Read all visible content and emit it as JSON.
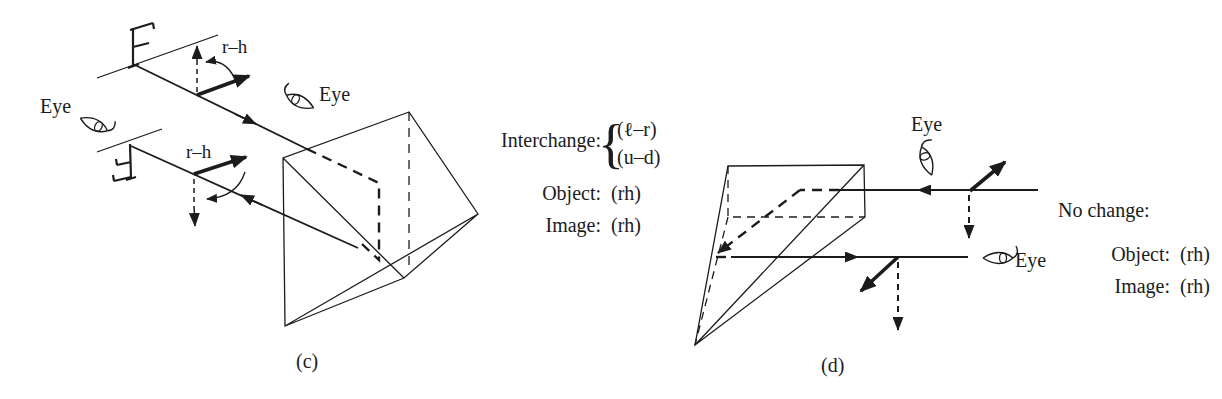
{
  "colors": {
    "ink": "#1c1c1c",
    "background": "#ffffff"
  },
  "figure_c": {
    "labels": {
      "eye_left": "Eye",
      "eye_top": "Eye",
      "rh_object": "r–h",
      "rh_image": "r–h",
      "caption": "(c)"
    },
    "summary": {
      "interchange_label": "Interchange:",
      "brace": "{",
      "interchange_items": [
        "(ℓ–r)",
        "(u–d)"
      ],
      "object_label": "Object:",
      "object_value": "(rh)",
      "image_label": "Image:",
      "image_value": "(rh)"
    }
  },
  "figure_d": {
    "labels": {
      "eye_top": "Eye",
      "eye_right": "Eye",
      "caption": "(d)"
    },
    "summary": {
      "no_change_label": "No change:",
      "object_label": "Object:",
      "object_value": "(rh)",
      "image_label": "Image:",
      "image_value": "(rh)"
    }
  }
}
